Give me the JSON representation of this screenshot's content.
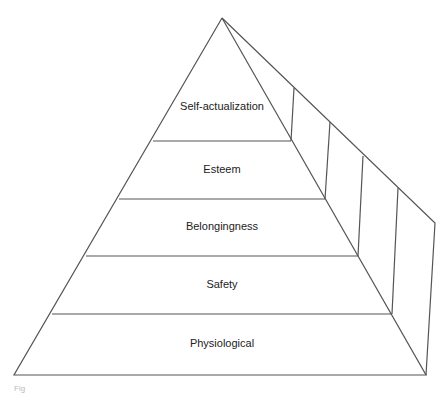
{
  "diagram": {
    "type": "pyramid",
    "levels": [
      {
        "label": "Self-actualization",
        "x": 222,
        "y": 107
      },
      {
        "label": "Esteem",
        "x": 222,
        "y": 166
      },
      {
        "label": "Belongingness",
        "x": 222,
        "y": 222
      },
      {
        "label": "Safety",
        "x": 222,
        "y": 280
      },
      {
        "label": "Physiological",
        "x": 222,
        "y": 338
      }
    ],
    "caption": "Fig"
  },
  "colors": {
    "line": "#555555",
    "background": "#ffffff"
  }
}
